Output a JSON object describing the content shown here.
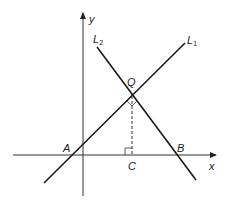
{
  "diagram": {
    "type": "coordinate-geometry",
    "colors": {
      "line": "#1a1a1a",
      "axis": "#333333",
      "text": "#222222"
    },
    "axes": {
      "x_label": "x",
      "y_label": "y"
    },
    "lines": [
      {
        "name": "L1",
        "label_main": "L",
        "label_sub": "1"
      },
      {
        "name": "L2",
        "label_main": "L",
        "label_sub": "2"
      }
    ],
    "points": {
      "Q": "Q",
      "A": "A",
      "B": "B",
      "C": "C"
    },
    "annotations": {
      "right_angle_at_Q": "right angle between L1 and L2 at Q",
      "right_angle_at_C": "QC perpendicular to x-axis",
      "dashed_segment": "QC"
    }
  }
}
